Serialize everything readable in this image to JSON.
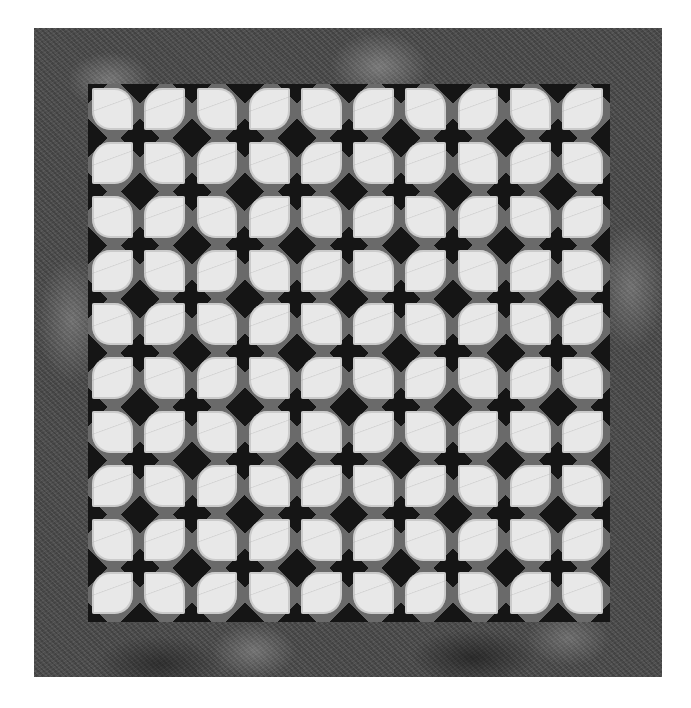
{
  "image": {
    "subject": "Quilt photographed flat on white background",
    "colors": {
      "background": "#ffffff",
      "border_fabric": "#4a4a4a",
      "sashing": "#6a6a6a",
      "star_fabric": "#151515",
      "leaf_fabric": "#e8e8e8"
    },
    "layout": {
      "grid_rows": 10,
      "grid_cols": 10,
      "pattern": "alternating leaf blocks forming dark four-pointed stars"
    }
  }
}
